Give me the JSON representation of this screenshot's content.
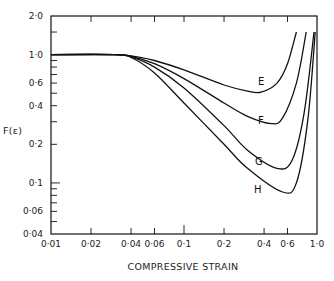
{
  "chart_data": {
    "type": "line",
    "title": "",
    "xlabel": "COMPRESSIVE STRAIN",
    "ylabel": "F(ε)",
    "xscale": "log",
    "yscale": "log",
    "xlim": [
      0.01,
      1.0
    ],
    "ylim": [
      0.04,
      2.0
    ],
    "grid": false,
    "legend": "inline curve labels",
    "x_ticks": [
      {
        "value": 0.01,
        "label": "0·01"
      },
      {
        "value": 0.02,
        "label": "0·02"
      },
      {
        "value": 0.04,
        "label": "0·04"
      },
      {
        "value": 0.06,
        "label": "0·06"
      },
      {
        "value": 0.1,
        "label": "0·1"
      },
      {
        "value": 0.2,
        "label": "0·2"
      },
      {
        "value": 0.4,
        "label": "0·4"
      },
      {
        "value": 0.6,
        "label": "0·6"
      },
      {
        "value": 1.0,
        "label": "1·0"
      }
    ],
    "y_ticks": [
      {
        "value": 2.0,
        "label": "2·0"
      },
      {
        "value": 1.0,
        "label": "1·0"
      },
      {
        "value": 0.6,
        "label": "0·6"
      },
      {
        "value": 0.4,
        "label": "0·4"
      },
      {
        "value": 0.2,
        "label": "0·2"
      },
      {
        "value": 0.1,
        "label": "0·1"
      },
      {
        "value": 0.06,
        "label": "0·06"
      },
      {
        "value": 0.04,
        "label": "0·04"
      }
    ],
    "series": [
      {
        "name": "E",
        "x": [
          0.01,
          0.03,
          0.04,
          0.06,
          0.1,
          0.2,
          0.3,
          0.38,
          0.5,
          0.6,
          0.7
        ],
        "y": [
          1.0,
          1.0,
          0.98,
          0.9,
          0.76,
          0.58,
          0.52,
          0.51,
          0.6,
          0.85,
          1.5
        ]
      },
      {
        "name": "F",
        "x": [
          0.01,
          0.03,
          0.04,
          0.06,
          0.1,
          0.2,
          0.3,
          0.45,
          0.55,
          0.7,
          0.83
        ],
        "y": [
          1.0,
          1.0,
          0.97,
          0.85,
          0.65,
          0.42,
          0.33,
          0.29,
          0.32,
          0.6,
          1.5
        ]
      },
      {
        "name": "G",
        "x": [
          0.01,
          0.03,
          0.04,
          0.06,
          0.1,
          0.2,
          0.3,
          0.5,
          0.65,
          0.8,
          0.95
        ],
        "y": [
          1.0,
          1.0,
          0.96,
          0.8,
          0.55,
          0.28,
          0.18,
          0.13,
          0.15,
          0.35,
          1.5
        ]
      },
      {
        "name": "H",
        "x": [
          0.01,
          0.03,
          0.04,
          0.06,
          0.1,
          0.2,
          0.3,
          0.55,
          0.7,
          0.85,
          0.97
        ],
        "y": [
          1.0,
          1.0,
          0.95,
          0.72,
          0.42,
          0.2,
          0.13,
          0.085,
          0.1,
          0.3,
          1.5
        ]
      }
    ]
  }
}
